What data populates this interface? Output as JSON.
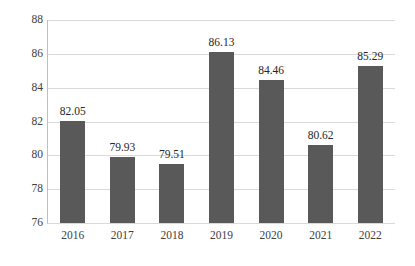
{
  "chart_data": {
    "type": "bar",
    "title": "",
    "subtitle": "",
    "xlabel": "",
    "ylabel": "",
    "categories": [
      "2016",
      "2017",
      "2018",
      "2019",
      "2020",
      "2021",
      "2022"
    ],
    "values": [
      82.05,
      79.93,
      79.51,
      86.13,
      84.46,
      80.62,
      85.29
    ],
    "data_labels": [
      "82.05",
      "79.93",
      "79.51",
      "86.13",
      "84.46",
      "80.62",
      "85.29"
    ],
    "ylim": [
      76,
      88
    ],
    "yticks": [
      76,
      78,
      80,
      82,
      84,
      86,
      88
    ],
    "ytick_labels": [
      "76",
      "78",
      "80",
      "82",
      "84",
      "86",
      "88"
    ],
    "grid": true,
    "grid_axis": "y",
    "legend": false,
    "legend_position": "none",
    "series": [
      {
        "name": "",
        "values": [
          82.05,
          79.93,
          79.51,
          86.13,
          84.46,
          80.62,
          85.29
        ]
      }
    ],
    "colors": {
      "bar": "#595959",
      "gridline": "#d9d9d9",
      "axis": "#bfbfbf",
      "text": "#404040",
      "background": "#ffffff"
    }
  }
}
